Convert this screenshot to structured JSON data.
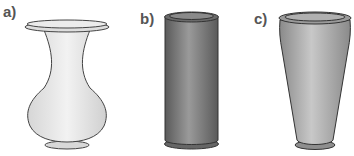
{
  "figure": {
    "panels": [
      {
        "label": "a)",
        "shape": "curved-vase",
        "fill": "#e4e4e4"
      },
      {
        "label": "b)",
        "shape": "cylinder-vase",
        "fill": "#7d7d7d"
      },
      {
        "label": "c)",
        "shape": "tapered-vase",
        "fill": "#a8a8a8"
      }
    ],
    "colors": {
      "outline": "#444444",
      "label": "#555555"
    }
  }
}
